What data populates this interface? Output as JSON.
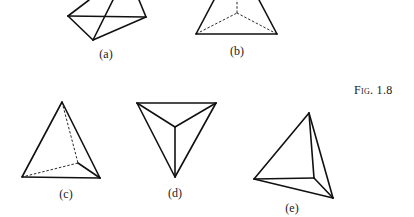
{
  "figure": {
    "caption": "Fig. 1.8",
    "stroke_color": "#111111",
    "background": "#ffffff"
  },
  "shapes": [
    {
      "id": "a",
      "label": "(a)",
      "label_pos": [
        106,
        47
      ],
      "solid": [
        [
          [
            68,
            16
          ],
          [
            146,
            17
          ]
        ],
        [
          [
            68,
            16
          ],
          [
            93,
            40
          ]
        ],
        [
          [
            93,
            40
          ],
          [
            146,
            17
          ]
        ],
        [
          [
            68,
            16
          ],
          [
            89,
            0
          ]
        ],
        [
          [
            146,
            17
          ],
          [
            139,
            0
          ]
        ],
        [
          [
            93,
            40
          ],
          [
            113,
            0
          ]
        ]
      ],
      "dashed": []
    },
    {
      "id": "b",
      "label": "(b)",
      "label_pos": [
        237,
        44
      ],
      "solid": [
        [
          [
            196,
            34
          ],
          [
            277,
            34
          ]
        ],
        [
          [
            196,
            34
          ],
          [
            214,
            0
          ]
        ],
        [
          [
            277,
            34
          ],
          [
            259,
            0
          ]
        ]
      ],
      "dashed": [
        [
          [
            196,
            34
          ],
          [
            237,
            13
          ]
        ],
        [
          [
            277,
            34
          ],
          [
            237,
            13
          ]
        ],
        [
          [
            237,
            13
          ],
          [
            237,
            0
          ]
        ]
      ]
    },
    {
      "id": "c",
      "label": "(c)",
      "label_pos": [
        66,
        187
      ],
      "solid": [
        [
          [
            62,
            102
          ],
          [
            22,
            177
          ]
        ],
        [
          [
            62,
            102
          ],
          [
            100,
            178
          ]
        ],
        [
          [
            22,
            177
          ],
          [
            100,
            178
          ]
        ],
        [
          [
            78,
            163
          ],
          [
            100,
            178
          ]
        ]
      ],
      "dashed": [
        [
          [
            62,
            102
          ],
          [
            78,
            163
          ]
        ],
        [
          [
            78,
            163
          ],
          [
            22,
            177
          ]
        ]
      ]
    },
    {
      "id": "d",
      "label": "(d)",
      "label_pos": [
        175,
        186
      ],
      "solid": [
        [
          [
            137,
            103
          ],
          [
            216,
            103
          ]
        ],
        [
          [
            137,
            103
          ],
          [
            175,
            177
          ]
        ],
        [
          [
            216,
            103
          ],
          [
            175,
            177
          ]
        ],
        [
          [
            137,
            103
          ],
          [
            175,
            127
          ]
        ],
        [
          [
            216,
            103
          ],
          [
            175,
            127
          ]
        ],
        [
          [
            175,
            127
          ],
          [
            175,
            177
          ]
        ]
      ],
      "dashed": []
    },
    {
      "id": "e",
      "label": "(e)",
      "label_pos": [
        292,
        201
      ],
      "solid": [
        [
          [
            309,
            113
          ],
          [
            254,
            179
          ]
        ],
        [
          [
            309,
            113
          ],
          [
            333,
            198
          ]
        ],
        [
          [
            254,
            179
          ],
          [
            333,
            198
          ]
        ],
        [
          [
            309,
            113
          ],
          [
            314,
            178
          ]
        ],
        [
          [
            254,
            179
          ],
          [
            314,
            178
          ]
        ],
        [
          [
            314,
            178
          ],
          [
            333,
            198
          ]
        ]
      ],
      "dashed": []
    }
  ]
}
